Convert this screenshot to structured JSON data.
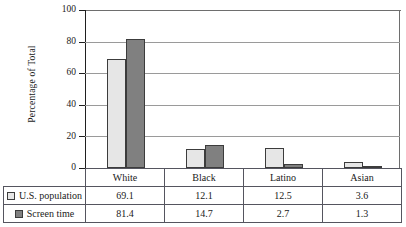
{
  "chart_data": {
    "type": "bar",
    "title": "",
    "xlabel": "",
    "ylabel": "Percentage of Total",
    "ylim": [
      0,
      100
    ],
    "yticks": [
      0,
      20,
      40,
      60,
      80,
      100
    ],
    "ytick_labels": [
      "0",
      "20",
      "40",
      "60",
      "80",
      "100"
    ],
    "grid": true,
    "grid_axis": "y",
    "legend_position": "table-below",
    "categories": [
      "White",
      "Black",
      "Latino",
      "Asian"
    ],
    "series": [
      {
        "name": "U.S. population",
        "color": "#e6e6e6",
        "values": [
          69.1,
          12.1,
          12.5,
          3.6
        ],
        "value_labels": [
          "69.1",
          "12.1",
          "12.5",
          "3.6"
        ]
      },
      {
        "name": "Screen time",
        "color": "#808080",
        "values": [
          81.4,
          14.7,
          2.7,
          1.3
        ],
        "value_labels": [
          "81.4",
          "14.7",
          "2.7",
          "1.3"
        ]
      }
    ]
  },
  "table": {
    "corner_label": "",
    "column_headers": [
      "White",
      "Black",
      "Latino",
      "Asian"
    ],
    "rows": [
      {
        "label": "U.S. population",
        "swatch": "light-gray-swatch",
        "cells": [
          "69.1",
          "12.1",
          "12.5",
          "3.6"
        ]
      },
      {
        "label": "Screen time",
        "swatch": "dark-gray-swatch",
        "cells": [
          "81.4",
          "14.7",
          "2.7",
          "1.3"
        ]
      }
    ]
  },
  "colors": {
    "series_us_population": "#e6e6e6",
    "series_screen_time": "#808080",
    "bar_border": "#3c3c3c",
    "axis": "#1f1f1f",
    "gridline": "#9a9a9a",
    "table_border": "#55555f"
  }
}
